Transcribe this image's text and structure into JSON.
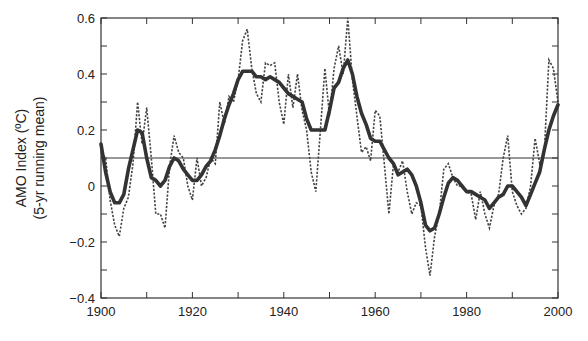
{
  "chart_data": {
    "type": "line",
    "title": "",
    "xlabel": "",
    "ylabel": "AMO Index (ºC)",
    "ylabel_line2": "(5-yr running mean)",
    "xlim": [
      1900,
      2000
    ],
    "ylim": [
      -0.4,
      0.6
    ],
    "x_ticks": [
      1900,
      1920,
      1940,
      1960,
      1980,
      2000
    ],
    "x_minor_ticks": [
      1910,
      1930,
      1950,
      1970,
      1990
    ],
    "y_ticks": [
      -0.4,
      -0.2,
      0,
      0.2,
      0.4,
      0.6
    ],
    "y_tick_labels": [
      "−0.4",
      "−0.2",
      "0",
      "0.2",
      "0.4",
      "0.6"
    ],
    "y_minor_ticks": [
      -0.3,
      -0.1,
      0.1,
      0.3,
      0.5
    ],
    "grid": false,
    "reference_line": {
      "y": 0.1,
      "style": "solid-thin"
    },
    "series": [
      {
        "name": "5-yr running mean (smoothed)",
        "style": "solid-thick",
        "color": "#333333",
        "x": [
          1900,
          1901,
          1902,
          1903,
          1904,
          1905,
          1906,
          1907,
          1908,
          1909,
          1910,
          1911,
          1912,
          1913,
          1914,
          1915,
          1916,
          1917,
          1918,
          1919,
          1920,
          1921,
          1922,
          1923,
          1924,
          1925,
          1926,
          1927,
          1928,
          1929,
          1930,
          1931,
          1932,
          1933,
          1934,
          1935,
          1936,
          1937,
          1938,
          1939,
          1940,
          1941,
          1942,
          1943,
          1944,
          1945,
          1946,
          1947,
          1948,
          1949,
          1950,
          1951,
          1952,
          1953,
          1954,
          1955,
          1956,
          1957,
          1958,
          1959,
          1960,
          1961,
          1962,
          1963,
          1964,
          1965,
          1966,
          1967,
          1968,
          1969,
          1970,
          1971,
          1972,
          1973,
          1974,
          1975,
          1976,
          1977,
          1978,
          1979,
          1980,
          1981,
          1982,
          1983,
          1984,
          1985,
          1986,
          1987,
          1988,
          1989,
          1990,
          1991,
          1992,
          1993,
          1994,
          1995,
          1996,
          1997,
          1998,
          1999,
          2000
        ],
        "values": [
          0.15,
          0.05,
          -0.02,
          -0.06,
          -0.06,
          -0.03,
          0.06,
          0.13,
          0.2,
          0.19,
          0.1,
          0.03,
          0.02,
          0.0,
          0.02,
          0.07,
          0.1,
          0.09,
          0.06,
          0.04,
          0.02,
          0.02,
          0.04,
          0.07,
          0.09,
          0.13,
          0.18,
          0.24,
          0.29,
          0.33,
          0.38,
          0.41,
          0.41,
          0.41,
          0.39,
          0.39,
          0.38,
          0.39,
          0.38,
          0.37,
          0.35,
          0.33,
          0.32,
          0.31,
          0.3,
          0.24,
          0.2,
          0.2,
          0.2,
          0.2,
          0.27,
          0.35,
          0.37,
          0.42,
          0.45,
          0.4,
          0.32,
          0.26,
          0.22,
          0.17,
          0.16,
          0.16,
          0.13,
          0.1,
          0.08,
          0.04,
          0.05,
          0.06,
          0.04,
          0.0,
          -0.06,
          -0.14,
          -0.16,
          -0.15,
          -0.1,
          -0.04,
          0.01,
          0.03,
          0.02,
          0.0,
          -0.02,
          -0.02,
          -0.03,
          -0.04,
          -0.05,
          -0.08,
          -0.06,
          -0.04,
          -0.03,
          0.0,
          0.0,
          -0.02,
          -0.04,
          -0.07,
          -0.03,
          0.01,
          0.05,
          0.13,
          0.2,
          0.25,
          0.29
        ]
      },
      {
        "name": "Annual values",
        "style": "dotted",
        "color": "#444444",
        "x": [
          1900,
          1901,
          1902,
          1903,
          1904,
          1905,
          1906,
          1907,
          1908,
          1909,
          1910,
          1911,
          1912,
          1913,
          1914,
          1915,
          1916,
          1917,
          1918,
          1919,
          1920,
          1921,
          1922,
          1923,
          1924,
          1925,
          1926,
          1927,
          1928,
          1929,
          1930,
          1931,
          1932,
          1933,
          1934,
          1935,
          1936,
          1937,
          1938,
          1939,
          1940,
          1941,
          1942,
          1943,
          1944,
          1945,
          1946,
          1947,
          1948,
          1949,
          1950,
          1951,
          1952,
          1953,
          1954,
          1955,
          1956,
          1957,
          1958,
          1959,
          1960,
          1961,
          1962,
          1963,
          1964,
          1965,
          1966,
          1967,
          1968,
          1969,
          1970,
          1971,
          1972,
          1973,
          1974,
          1975,
          1976,
          1977,
          1978,
          1979,
          1980,
          1981,
          1982,
          1983,
          1984,
          1985,
          1986,
          1987,
          1988,
          1989,
          1990,
          1991,
          1992,
          1993,
          1994,
          1995,
          1996,
          1997,
          1998,
          1999,
          2000
        ],
        "values": [
          0.12,
          0.1,
          -0.05,
          -0.14,
          -0.18,
          -0.08,
          -0.04,
          0.08,
          0.3,
          0.15,
          0.28,
          0.1,
          -0.1,
          -0.1,
          -0.15,
          0.07,
          0.18,
          0.12,
          0.1,
          0.0,
          -0.05,
          0.1,
          0.0,
          0.03,
          0.1,
          0.08,
          0.3,
          0.22,
          0.32,
          0.3,
          0.38,
          0.52,
          0.56,
          0.42,
          0.33,
          0.3,
          0.44,
          0.43,
          0.44,
          0.3,
          0.22,
          0.4,
          0.28,
          0.4,
          0.27,
          0.2,
          0.05,
          -0.02,
          0.2,
          0.42,
          0.25,
          0.42,
          0.5,
          0.4,
          0.6,
          0.38,
          0.25,
          0.12,
          0.14,
          0.09,
          0.27,
          0.25,
          0.08,
          -0.1,
          0.08,
          0.05,
          0.09,
          -0.02,
          -0.1,
          -0.06,
          -0.07,
          -0.22,
          -0.32,
          -0.18,
          -0.1,
          0.06,
          0.08,
          0.03,
          0.0,
          0.0,
          -0.02,
          -0.03,
          -0.12,
          -0.02,
          -0.1,
          -0.15,
          -0.07,
          -0.03,
          0.1,
          0.18,
          -0.02,
          -0.07,
          -0.1,
          -0.08,
          0.0,
          0.17,
          0.08,
          0.12,
          0.45,
          0.42,
          0.3
        ]
      }
    ]
  },
  "axes": {
    "x_tick_labels": [
      "1900",
      "1920",
      "1940",
      "1960",
      "1980",
      "2000"
    ],
    "y_tick_labels": [
      "0.6",
      "0.4",
      "0.2",
      "0",
      "−0.2",
      "−0.4"
    ],
    "ylabel_line1": "AMO Index (ºC)",
    "ylabel_line2": "(5-yr running mean)"
  },
  "colors": {
    "frame": "#333333",
    "smooth": "#333333",
    "dotted": "#444444",
    "text": "#222222"
  }
}
